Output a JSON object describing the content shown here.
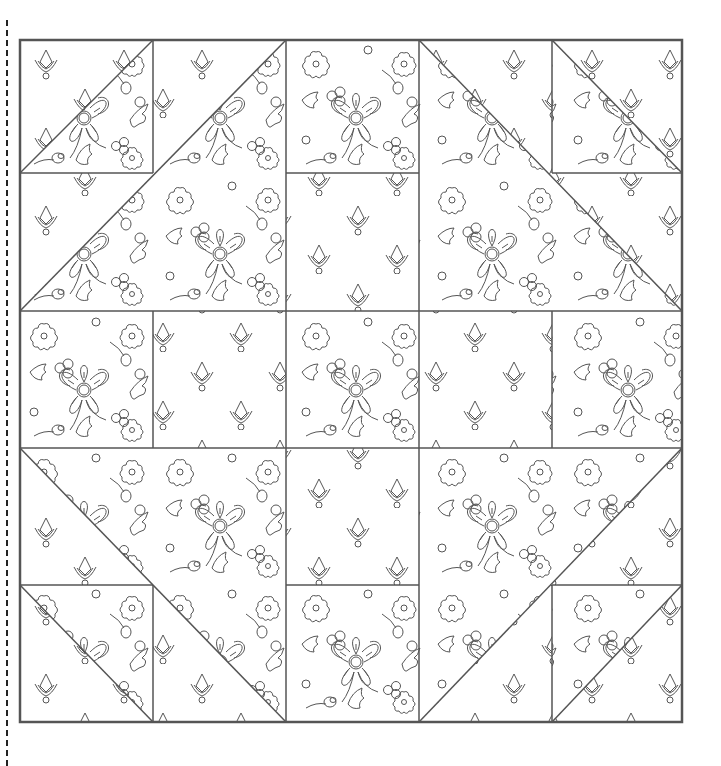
{
  "page": {
    "cut_line": "dashed"
  },
  "block": {
    "grid": 5,
    "origin": [
      20,
      40
    ],
    "size": 662,
    "stroke": "#555555",
    "background": "#ffffff",
    "fabrics": {
      "floral": "floral print (flowers, berries, leaves, buds)",
      "motif": "sparse drop motif print"
    },
    "pieces": [
      {
        "type": "hst",
        "cell": [
          0,
          0
        ],
        "diag": "bl-tr",
        "a": "motif",
        "b": "floral"
      },
      {
        "type": "hst",
        "cell": [
          4,
          0
        ],
        "diag": "tl-br",
        "a": "motif",
        "b": "floral"
      },
      {
        "type": "hst",
        "cell": [
          0,
          4
        ],
        "diag": "tl-br",
        "a": "motif",
        "b": "floral"
      },
      {
        "type": "hst",
        "cell": [
          4,
          4
        ],
        "diag": "bl-tr",
        "a": "motif",
        "b": "floral"
      },
      {
        "type": "bighst",
        "cells": [
          1,
          0,
          2,
          2
        ],
        "diag": "bl-tr",
        "a": "motif",
        "b": "floral"
      },
      {
        "type": "bighst",
        "cells": [
          3,
          0,
          2,
          2
        ],
        "diag": "tl-br",
        "a": "motif",
        "b": "floral"
      },
      {
        "type": "bighst",
        "cells": [
          0,
          1,
          2,
          2
        ],
        "diag": "bl-tr",
        "a": "motif",
        "b": "floral"
      },
      {
        "type": "bighst",
        "cells": [
          3,
          1,
          2,
          2
        ],
        "diag": "tl-br",
        "a": "motif",
        "b": "floral"
      },
      {
        "type": "bighst",
        "cells": [
          0,
          3,
          2,
          2
        ],
        "diag": "tl-br",
        "a": "motif",
        "b": "floral"
      },
      {
        "type": "bighst",
        "cells": [
          3,
          3,
          2,
          2
        ],
        "diag": "bl-tr",
        "a": "motif",
        "b": "floral"
      },
      {
        "type": "bighst",
        "cells": [
          1,
          3,
          2,
          2
        ],
        "diag": "tl-br",
        "a": "motif",
        "b": "floral"
      },
      {
        "type": "bighst",
        "cells": [
          3,
          3,
          2,
          2
        ],
        "diag": "bl-tr",
        "a": "motif",
        "b": "floral"
      }
    ],
    "squares": {
      "motif": [
        [
          2,
          1
        ],
        [
          1,
          2
        ],
        [
          3,
          2
        ],
        [
          2,
          3
        ]
      ],
      "floral": [
        [
          2,
          0
        ],
        [
          0,
          2
        ],
        [
          2,
          2
        ],
        [
          4,
          2
        ],
        [
          2,
          4
        ]
      ]
    }
  }
}
